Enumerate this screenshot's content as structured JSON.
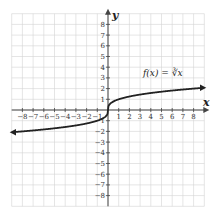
{
  "chart_data": {
    "type": "line",
    "title": "",
    "xlabel": "x",
    "ylabel": "y",
    "xlim": [
      -9,
      9
    ],
    "ylim": [
      -9,
      9
    ],
    "grid": true,
    "x_ticks": [
      -8,
      -7,
      -6,
      -5,
      -4,
      -3,
      -2,
      -1,
      1,
      2,
      3,
      4,
      5,
      6,
      7,
      8
    ],
    "y_ticks": [
      8,
      7,
      6,
      5,
      4,
      3,
      2,
      1,
      -1,
      -2,
      -3,
      -4,
      -5,
      -6,
      -7,
      -8
    ],
    "series": [
      {
        "name": "f(x) = ∛x",
        "function": "cbrt",
        "x": [
          -9,
          -8,
          -6,
          -4,
          -2,
          -1,
          -0.5,
          -0.1,
          0,
          0.1,
          0.5,
          1,
          2,
          4,
          6,
          8,
          9
        ],
        "y": [
          -2.08,
          -2,
          -1.82,
          -1.59,
          -1.26,
          -1,
          -0.79,
          -0.46,
          0,
          0.46,
          0.79,
          1,
          1.26,
          1.59,
          1.82,
          2,
          2.08
        ],
        "arrows": "both"
      }
    ],
    "annotations": [
      {
        "text": "f(x) = ∛x",
        "x": 6,
        "y": 3.2
      }
    ]
  },
  "labels": {
    "x_axis": "x",
    "y_axis": "y",
    "function": "f(x) = ∛x"
  },
  "colors": {
    "grid": "#d4d4d4",
    "axis": "#444444",
    "curve": "#222222"
  }
}
